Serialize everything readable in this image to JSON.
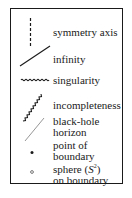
{
  "legend": {
    "items": [
      {
        "symbol": "dashed-vertical-line",
        "lines": [
          "symmetry axis"
        ]
      },
      {
        "symbol": "solid-diagonal-line",
        "lines": [
          "infinity"
        ]
      },
      {
        "symbol": "wavy-horizontal-line",
        "lines": [
          "singularity"
        ]
      },
      {
        "symbol": "zigzag-diagonal-line",
        "lines": [
          "incompleteness"
        ]
      },
      {
        "symbol": "thin-gray-diagonal-line",
        "lines": [
          "black-hole",
          "horizon"
        ]
      },
      {
        "symbol": "filled-dot",
        "lines": [
          "point of",
          "boundary"
        ]
      },
      {
        "symbol": "open-circle",
        "lines": [
          "sphere (S²)",
          "on boundary"
        ],
        "sphere_prefix": "sphere (",
        "sphere_var": "S",
        "sphere_exp": "2",
        "sphere_suffix": ")"
      }
    ]
  },
  "colors": {
    "ink": "#1a1a1a",
    "horizon_gray": "#8a8a8a",
    "background": "#ffffff"
  }
}
